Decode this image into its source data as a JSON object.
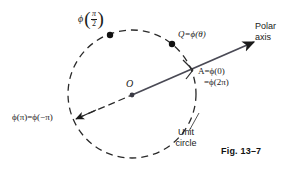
{
  "figure": {
    "caption": "Fig. 13–7",
    "background_color": "#ffffff",
    "ink_color": "#1a1a1a"
  },
  "labels": {
    "phi_half_pi": {
      "phi": "ϕ",
      "numerator": "π",
      "denominator": "2",
      "open_paren": "(",
      "close_paren": ")"
    },
    "q_point": "Q=ϕ(θ)",
    "polar_axis": "Polar axis",
    "a_point_line1": "A=ϕ(0)",
    "a_point_line2": "=ϕ(2π)",
    "phi_pi": "ϕ(π)=ϕ(−π)",
    "unit_circle": "Unit circle",
    "origin": "O"
  },
  "geometry": {
    "circle": {
      "cx": 132,
      "cy": 94,
      "r": 64,
      "style": "dashed"
    },
    "origin_point": {
      "x": 132,
      "y": 95
    },
    "point_a": {
      "x": 192,
      "y": 70
    },
    "point_q": {
      "x": 172,
      "y": 44
    },
    "point_phi_half_pi": {
      "x": 110,
      "y": 35
    },
    "point_phi_pi": {
      "x": 76,
      "y": 119
    },
    "axis_arrow_tip": {
      "x": 256,
      "y": 41
    }
  }
}
